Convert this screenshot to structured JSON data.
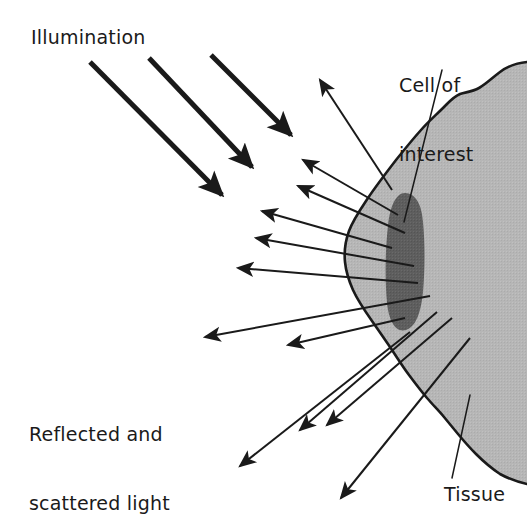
{
  "figure": {
    "kind": "scientific-diagram",
    "background_color": "#ffffff",
    "ink_color": "#1a1a1a"
  },
  "labels": {
    "illumination": "Illumination",
    "cell_of_interest_line1": "Cell of",
    "cell_of_interest_line2": "interest",
    "reflected_line1": "Reflected and",
    "reflected_line2": "scattered light",
    "tissue": "Tissue"
  },
  "regions": {
    "tissue": {
      "name": "Tissue",
      "fill_color": "#b6b6b6",
      "outline_color": "#1a1a1a"
    },
    "cell": {
      "name": "Cell of interest",
      "fill_color": "#5e5e5e",
      "shape": "elongated vertical ellipse"
    }
  },
  "rays": {
    "illumination": {
      "name": "Illumination beams",
      "count": 3,
      "color": "#1a1a1a",
      "direction": "down-right",
      "stroke_width": 5
    },
    "scattered": {
      "name": "Reflected and scattered light rays",
      "count": 12,
      "color": "#1a1a1a",
      "direction": "radiating outward from cell",
      "stroke_width": 2
    }
  },
  "leaders": {
    "cell_of_interest": "leader line from label to cell",
    "tissue": "leader line from label to tissue boundary"
  }
}
